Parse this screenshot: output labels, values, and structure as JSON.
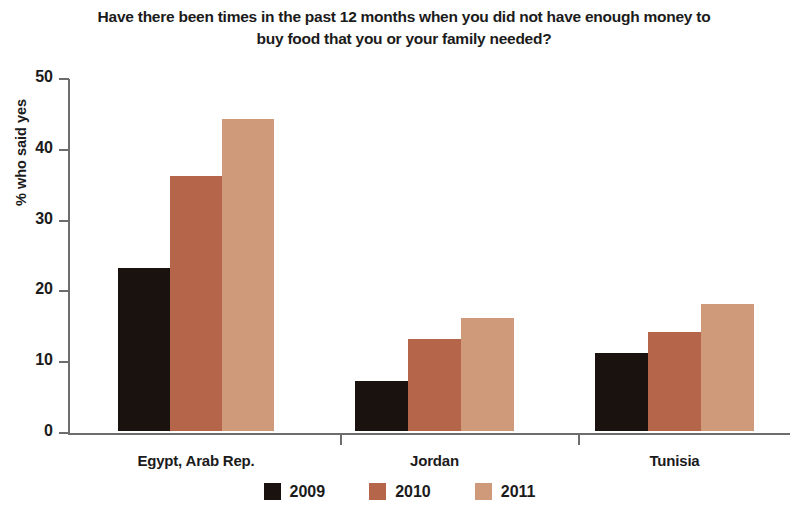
{
  "chart_data": {
    "type": "bar",
    "title": "Have there been times in the past 12 months when you did not have enough money to\nbuy food that you or your family needed?",
    "xlabel": "",
    "ylabel": "% who said yes",
    "ylim": [
      0,
      50
    ],
    "yticks": [
      0,
      10,
      20,
      30,
      40,
      50
    ],
    "ytick_labels": [
      "0",
      "10",
      "20",
      "30",
      "40",
      "50"
    ],
    "grid": false,
    "legend_position": "bottom-center",
    "categories": [
      "Egypt, Arab Rep.",
      "Jordan",
      "Tunisia"
    ],
    "series": [
      {
        "name": "2009",
        "color": "#1a120e",
        "values": [
          23,
          7,
          11
        ]
      },
      {
        "name": "2010",
        "color": "#b4654a",
        "values": [
          36,
          13,
          14
        ]
      },
      {
        "name": "2011",
        "color": "#cf9a7a",
        "values": [
          44,
          16,
          18
        ]
      }
    ]
  }
}
